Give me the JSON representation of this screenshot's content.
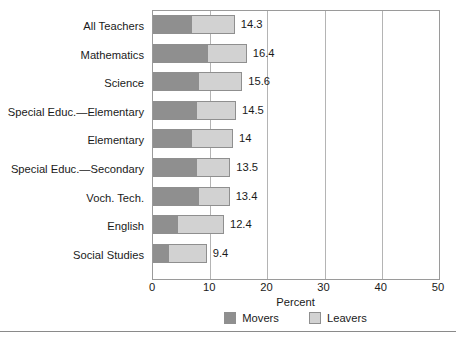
{
  "chart_data": {
    "type": "bar",
    "orientation": "horizontal",
    "stacked": true,
    "title": "",
    "xlabel": "Percent",
    "ylabel": "",
    "xlim": [
      0,
      50
    ],
    "xticks": [
      0,
      10,
      20,
      30,
      40,
      50
    ],
    "grid": "vertical",
    "legend_position": "bottom-center",
    "categories": [
      "All Teachers",
      "Mathematics",
      "Science",
      "Special Educ.—Elementary",
      "Elementary",
      "Special Educ.—Secondary",
      "Voch. Tech.",
      "English",
      "Social Studies"
    ],
    "series": [
      {
        "name": "Movers",
        "color": "#8f8f8f",
        "values": [
          6.8,
          9.6,
          8.1,
          7.7,
          6.8,
          7.7,
          8.0,
          4.4,
          2.8
        ]
      },
      {
        "name": "Leavers",
        "color": "#d2d2d2",
        "values": [
          7.5,
          6.8,
          7.5,
          6.8,
          7.2,
          5.8,
          5.4,
          8.0,
          6.6
        ]
      }
    ],
    "totals": [
      14.3,
      16.4,
      15.6,
      14.5,
      14,
      13.5,
      13.4,
      12.4,
      9.4
    ],
    "total_labels": [
      "14.3",
      "16.4",
      "15.6",
      "14.5",
      "14",
      "13.5",
      "13.4",
      "12.4",
      "9.4"
    ]
  },
  "axis": {
    "x_tick_labels": [
      "0",
      "10",
      "20",
      "30",
      "40",
      "50"
    ],
    "x_title": "Percent"
  },
  "legend": {
    "entries": [
      {
        "label": "Movers",
        "swatch": "#8f8f8f"
      },
      {
        "label": "Leavers",
        "swatch": "#d2d2d2"
      }
    ]
  }
}
